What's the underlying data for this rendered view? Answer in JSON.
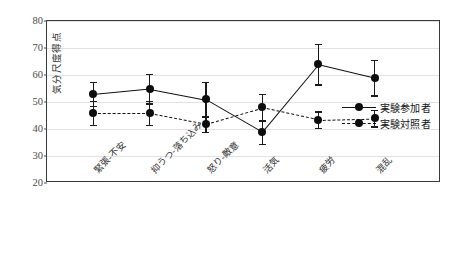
{
  "chart_data": {
    "type": "line",
    "title": "",
    "xlabel": "",
    "ylabel": "気分尺度得点",
    "ylim": [
      20,
      80
    ],
    "yticks": [
      20,
      30,
      40,
      50,
      60,
      70,
      80
    ],
    "ytick_labels": [
      "20",
      "30",
      "40",
      "50",
      "60",
      "70",
      "80"
    ],
    "grid": true,
    "grid_axis": "y",
    "legend_position": "right-inside",
    "categories": [
      "緊張-不安",
      "抑うつ-落ち込み",
      "怒り-敵意",
      "活気",
      "疲労",
      "混乱"
    ],
    "series": [
      {
        "name": "実験参加者",
        "linestyle": "solid",
        "marker": "circle",
        "color": "#111111",
        "values": [
          53,
          55,
          51,
          39,
          64,
          59
        ],
        "errors": [
          4.5,
          5.5,
          6.5,
          4.5,
          7.5,
          6.5
        ]
      },
      {
        "name": "実験対照者",
        "linestyle": "dashed",
        "marker": "circle",
        "color": "#111111",
        "values": [
          46,
          46,
          42,
          48,
          43.5,
          44
        ],
        "errors": [
          4.5,
          4.5,
          3.0,
          5.0,
          3.0,
          3.0
        ]
      }
    ]
  },
  "legend": {
    "items": [
      {
        "label": "実験参加者",
        "style": "solid"
      },
      {
        "label": "実験対照者",
        "style": "dashed"
      }
    ]
  },
  "caption": {
    "text": ""
  }
}
